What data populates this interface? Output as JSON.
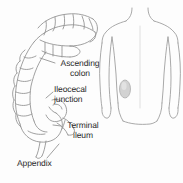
{
  "figure": {
    "width": 183,
    "height": 183,
    "background_color": "#fdfdfd",
    "line_color": "#8a8a8a",
    "text_color": "#2b2b2b"
  },
  "left_panel": {
    "name": "colon-anatomy-drawing",
    "description": "Line drawing of the large intestine showing the ascending colon, cecum, ileocecal junction, terminal ileum and appendix",
    "labels": [
      {
        "id": "ascending-colon",
        "text": "Ascending\ncolon"
      },
      {
        "id": "ileocecal-junction",
        "text": "Ileocecal\njunction"
      },
      {
        "id": "terminal-ileum",
        "text": "Terminal\nileum"
      },
      {
        "id": "appendix",
        "text": "Appendix"
      }
    ]
  },
  "right_panel": {
    "name": "torso-location-diagram",
    "description": "Outline of a human torso with a shaded oval marking the lower right quadrant",
    "marker": {
      "id": "appendix-location-marker",
      "fill_color": "#cfcfcf",
      "stroke_color": "#9a9a9a"
    },
    "caption": "The appendix\nis in the lower\nright quadrangle"
  }
}
